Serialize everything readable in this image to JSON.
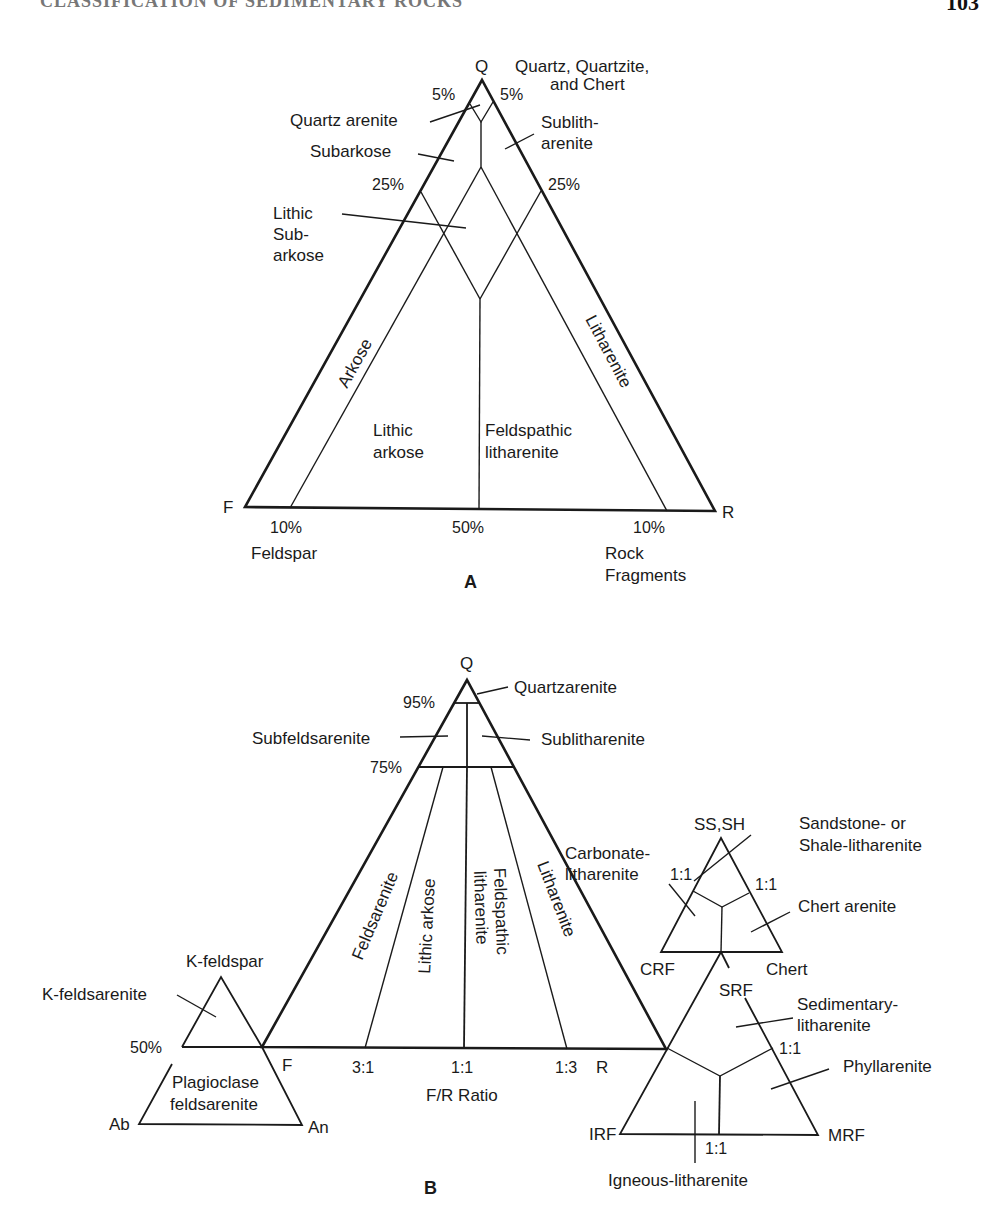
{
  "page": {
    "running_header": "CLASSIFICATION OF SEDIMENTARY ROCKS",
    "page_number": "103"
  },
  "diagram_a": {
    "panel_label": "A",
    "apex": {
      "pole": "Q",
      "pole_desc_line1": "Quartz, Quartzite,",
      "pole_desc_line2": "and Chert"
    },
    "left_corner": "F",
    "right_corner": "R",
    "left_pole_desc": "Feldspar",
    "right_pole_desc_line1": "Rock",
    "right_pole_desc_line2": "Fragments",
    "ticks": {
      "q5_left": "5%",
      "q5_right": "5%",
      "q25_left": "25%",
      "q25_right": "25%",
      "base_left": "10%",
      "base_mid": "50%",
      "base_right": "10%"
    },
    "fields": {
      "quartz_arenite": "Quartz arenite",
      "subarkose": "Subarkose",
      "sublitharenite_line1": "Sublith-",
      "sublitharenite_line2": "arenite",
      "lithic_subarkose_line1": "Lithic",
      "lithic_subarkose_line2": "Sub-",
      "lithic_subarkose_line3": "arkose",
      "arkose": "Arkose",
      "litharenite": "Litharenite",
      "lithic_arkose_line1": "Lithic",
      "lithic_arkose_line2": "arkose",
      "feldspathic_litharenite_line1": "Feldspathic",
      "feldspathic_litharenite_line2": "litharenite"
    }
  },
  "diagram_b": {
    "panel_label": "B",
    "main": {
      "apex": "Q",
      "left_corner": "F",
      "right_corner": "R",
      "axis_title": "F/R Ratio",
      "ticks": {
        "q95": "95%",
        "q75": "75%",
        "r31": "3:1",
        "r11": "1:1",
        "r13": "1:3"
      },
      "fields": {
        "quartzarenite": "Quartzarenite",
        "subfeldsarenite": "Subfeldsarenite",
        "sublitharenite": "Sublitharenite",
        "feldsarenite": "Feldsarenite",
        "lithic_arkose": "Lithic arkose",
        "feldspathic_litharenite_line1": "Feldspathic",
        "feldspathic_litharenite_line2": "litharenite",
        "litharenite": "Litharenite"
      }
    },
    "feldspar_sub": {
      "apex": "K-feldspar",
      "left_corner": "Ab",
      "right_corner": "An",
      "tick50": "50%",
      "fields": {
        "k_feldsarenite": "K-feldsarenite",
        "plagioclase_line1": "Plagioclase",
        "plagioclase_line2": "feldsarenite"
      }
    },
    "sedimentary_sub": {
      "apex": "SS,SH",
      "left_corner": "CRF",
      "right_corner": "Chert",
      "tick_left": "1:1",
      "tick_right": "1:1",
      "fields": {
        "carbonate_line1": "Carbonate-",
        "carbonate_line2": "litharenite",
        "sandstone_line1": "Sandstone- or",
        "sandstone_line2": "Shale-litharenite",
        "chert_arenite": "Chert arenite"
      }
    },
    "rock_fragment_sub": {
      "apex": "SRF",
      "left_corner": "IRF",
      "right_corner": "MRF",
      "tick_right": "1:1",
      "tick_base": "1:1",
      "fields": {
        "sedimentary_line1": "Sedimentary-",
        "sedimentary_line2": "litharenite",
        "phyllarenite": "Phyllarenite",
        "igneous": "Igneous-litharenite"
      }
    }
  }
}
